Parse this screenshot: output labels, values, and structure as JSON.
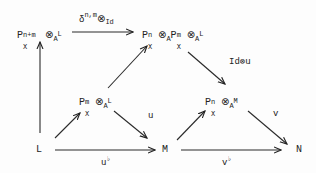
{
  "diagram": {
    "type": "commutative-diagram",
    "nodes": {
      "top_left": {
        "base": "P",
        "sup": "n+m",
        "sub": "X",
        "otimes": "⊗",
        "ring": "A",
        "tail": "L"
      },
      "top_right": {
        "base1": "P",
        "sup1": "n",
        "sub1": "X",
        "otimes1": "⊗",
        "ring1": "A",
        "base2": "P",
        "sup2": "m",
        "sub2": "X",
        "otimes2": "⊗",
        "ring2": "A",
        "tail": "L"
      },
      "mid_left": {
        "base": "P",
        "sup": "m",
        "sub": "X",
        "otimes": "⊗",
        "ring": "A",
        "tail": "L"
      },
      "mid_right": {
        "base": "P",
        "sup": "n",
        "sub": "X",
        "otimes": "⊗",
        "ring": "A",
        "tail": "M"
      },
      "bottom_left": "L",
      "bottom_mid": "M",
      "bottom_right": "N"
    },
    "arrows": {
      "top": {
        "label_main": "δ",
        "label_sup": "n,m",
        "label_otimes": "⊗",
        "label_tail": "Id",
        "from": "P^{n+m}_X ⊗_A L",
        "to": "P^n_X ⊗_A P^m_X ⊗_A L"
      },
      "left_vertical": {
        "label": "",
        "from": "L",
        "to": "P^{n+m}_X ⊗_A L"
      },
      "L_to_midleft": {
        "label": "",
        "from": "L",
        "to": "P^m_X ⊗_A L"
      },
      "midleft_to_topright": {
        "label": "",
        "from": "P^m_X ⊗_A L",
        "to": "P^n_X ⊗_A P^m_X ⊗_A L"
      },
      "midleft_to_M": {
        "label": "u",
        "from": "P^m_X ⊗_A L",
        "to": "M"
      },
      "topright_to_midright": {
        "label": "Id⊗u",
        "from": "P^n_X ⊗_A P^m_X ⊗_A L",
        "to": "P^n_X ⊗_A M"
      },
      "M_to_midright": {
        "label": "",
        "from": "M",
        "to": "P^n_X ⊗_A M"
      },
      "midright_to_N": {
        "label": "v",
        "from": "P^n_X ⊗_A M",
        "to": "N"
      },
      "L_to_M": {
        "label": "u",
        "label_sup": "♭",
        "from": "L",
        "to": "M"
      },
      "M_to_N": {
        "label": "v",
        "label_sup": "♭",
        "from": "M",
        "to": "N"
      }
    }
  }
}
